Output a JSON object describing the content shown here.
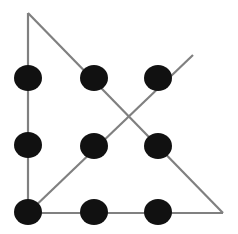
{
  "figure": {
    "width": 238,
    "height": 234,
    "background_color": "#ffffff"
  },
  "style": {
    "dot_color": "#111111",
    "line_color": "#808080",
    "line_width": 2.2,
    "dot_radius_x": 14,
    "dot_radius_y": 13
  },
  "chart_data": {
    "type": "scatter",
    "title": "",
    "xlabel": "",
    "ylabel": "",
    "xlim": [
      0,
      238
    ],
    "ylim": [
      0,
      234
    ],
    "grid": false,
    "legend": null,
    "series": [
      {
        "name": "dots",
        "marker": "filled-circle",
        "color": "#111111",
        "points": [
          {
            "id": "dot-top-left",
            "row": 0,
            "col": 0,
            "x": 28,
            "y": 78
          },
          {
            "id": "dot-top-center",
            "row": 0,
            "col": 1,
            "x": 94,
            "y": 78
          },
          {
            "id": "dot-top-right",
            "row": 0,
            "col": 2,
            "x": 158,
            "y": 78
          },
          {
            "id": "dot-middle-left",
            "row": 1,
            "col": 0,
            "x": 28,
            "y": 145
          },
          {
            "id": "dot-middle-center",
            "row": 1,
            "col": 1,
            "x": 94,
            "y": 146
          },
          {
            "id": "dot-middle-right",
            "row": 1,
            "col": 2,
            "x": 158,
            "y": 146
          },
          {
            "id": "dot-bottom-left",
            "row": 2,
            "col": 0,
            "x": 28,
            "y": 212
          },
          {
            "id": "dot-bottom-center",
            "row": 2,
            "col": 1,
            "x": 94,
            "y": 212
          },
          {
            "id": "dot-bottom-right",
            "row": 2,
            "col": 2,
            "x": 158,
            "y": 212
          }
        ]
      }
    ],
    "lines": [
      {
        "id": "line-vertical-left",
        "name": "vertical-left-column-line",
        "color": "#808080",
        "from": {
          "x": 28,
          "y": 13
        },
        "to": {
          "x": 28,
          "y": 213
        }
      },
      {
        "id": "line-diagonal-descending",
        "name": "descending-diagonal-line",
        "color": "#808080",
        "from": {
          "x": 28,
          "y": 13
        },
        "to": {
          "x": 223,
          "y": 213
        }
      },
      {
        "id": "line-horizontal-bottom",
        "name": "bottom-horizontal-line",
        "color": "#808080",
        "from": {
          "x": 27,
          "y": 213
        },
        "to": {
          "x": 223,
          "y": 213
        }
      },
      {
        "id": "line-diagonal-ascending",
        "name": "ascending-diagonal-line",
        "color": "#808080",
        "from": {
          "x": 28,
          "y": 213
        },
        "to": {
          "x": 193,
          "y": 55
        }
      }
    ],
    "vertices": [
      {
        "id": "apex-top",
        "x": 28,
        "y": 13
      },
      {
        "id": "corner-bottom-left",
        "x": 28,
        "y": 213
      },
      {
        "id": "corner-bottom-right",
        "x": 223,
        "y": 213
      },
      {
        "id": "ray-end-top-right",
        "x": 193,
        "y": 55
      },
      {
        "id": "diagonal-crossing",
        "x": 125,
        "y": 115
      }
    ]
  }
}
